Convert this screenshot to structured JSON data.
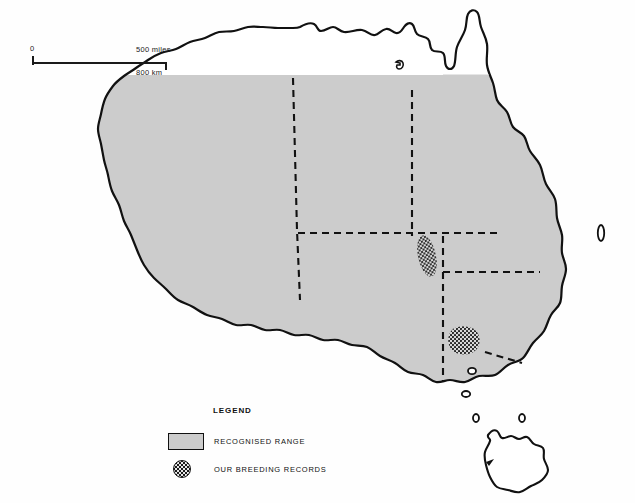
{
  "page": {
    "background_color": "#fefefe"
  },
  "colors": {
    "range_fill": "#cccccc",
    "outline": "#111111",
    "unshaded_fill": "#ffffff",
    "stipple_dot": "#1a1a1a"
  },
  "scale_bar": {
    "zero_label": "0",
    "miles_label": "500 miles",
    "km_label": "800 km"
  },
  "legend": {
    "title": "LEGEND",
    "items": [
      {
        "symbol": "gray-rectangle",
        "label": "RECOGNISED RANGE"
      },
      {
        "symbol": "stippled-circle",
        "label": "OUR BREEDING RECORDS"
      }
    ]
  },
  "map": {
    "region": "Australia",
    "shaded_range_note": "mainland shaded except Cape York tip and Tasmania",
    "unshaded_areas": [
      "Cape York Peninsula tip",
      "Tasmania"
    ],
    "state_borders_style": "dashed",
    "breeding_record_patches": [
      {
        "name": "south-west-queensland-patch",
        "shape": "elongated-oval",
        "cx": 427,
        "cy": 256
      },
      {
        "name": "murray-region-patch",
        "shape": "rounded-blob",
        "cx": 466,
        "cy": 341
      }
    ],
    "offshore_islands": [
      "fraser-island",
      "kangaroo-island",
      "king-island",
      "flinders-island"
    ]
  }
}
